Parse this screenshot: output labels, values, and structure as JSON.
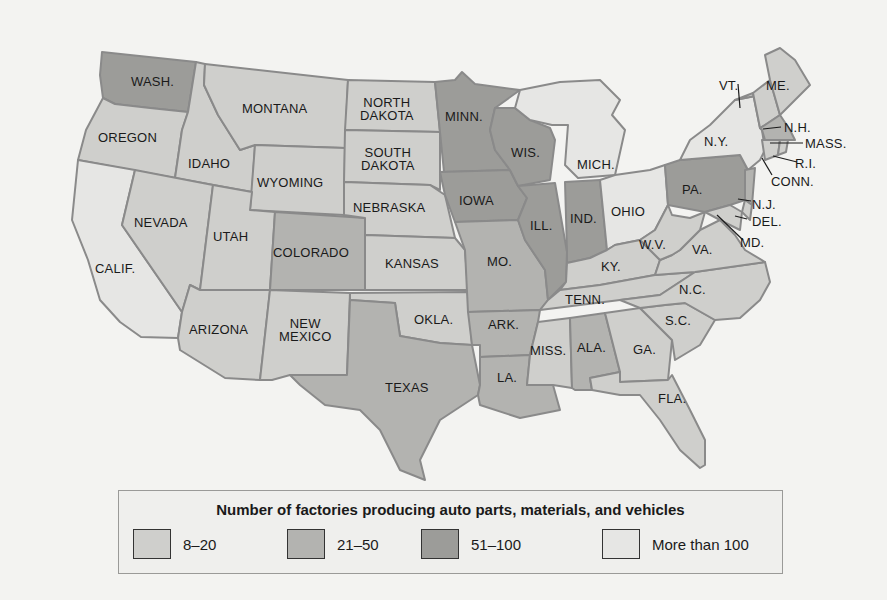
{
  "legend": {
    "title": "Number of factories producing auto parts, materials, and vehicles",
    "items": [
      {
        "label": "8–20",
        "color": "#cfcfcc"
      },
      {
        "label": "21–50",
        "color": "#b3b3b0"
      },
      {
        "label": "51–100",
        "color": "#9c9c99"
      },
      {
        "label": "More than 100",
        "color": "#e6e6e4"
      }
    ]
  },
  "states": {
    "wash": "WASH.",
    "oregon": "OREGON",
    "calif": "CALIF.",
    "idaho": "IDAHO",
    "nevada": "NEVADA",
    "montana": "MONTANA",
    "wyoming": "WYOMING",
    "utah": "UTAH",
    "arizona": "ARIZONA",
    "colorado": "COLORADO",
    "new_mexico": "NEW\nMEXICO",
    "north_dakota": "NORTH\nDAKOTA",
    "south_dakota": "SOUTH\nDAKOTA",
    "nebraska": "NEBRASKA",
    "kansas": "KANSAS",
    "okla": "OKLA.",
    "texas": "TEXAS",
    "minn": "MINN.",
    "iowa": "IOWA",
    "mo": "MO.",
    "ark": "ARK.",
    "la": "LA.",
    "wis": "WIS.",
    "ill": "ILL.",
    "mich": "MICH.",
    "ind": "IND.",
    "ohio": "OHIO",
    "ky": "KY.",
    "tenn": "TENN.",
    "miss": "MISS.",
    "ala": "ALA.",
    "ga": "GA.",
    "fla": "FLA.",
    "sc": "S.C.",
    "nc": "N.C.",
    "va": "VA.",
    "wv": "W.V.",
    "pa": "PA.",
    "ny": "N.Y.",
    "vt": "VT.",
    "me": "ME.",
    "nh": "N.H.",
    "mass": "MASS.",
    "ri": "R.I.",
    "conn": "CONN.",
    "nj": "N.J.",
    "del": "DEL.",
    "md": "MD."
  },
  "categories": {
    "8-20": [
      "Oregon",
      "Idaho",
      "Montana",
      "Wyoming",
      "Nevada",
      "Utah",
      "Arizona",
      "New Mexico",
      "North Dakota",
      "South Dakota",
      "Nebraska",
      "Kansas",
      "Oklahoma",
      "Kentucky",
      "West Virginia",
      "Virginia",
      "Mississippi",
      "Georgia",
      "South Carolina",
      "Florida",
      "Tennessee",
      "North Carolina",
      "Vermont",
      "New Hampshire",
      "Maine",
      "Connecticut",
      "Rhode Island",
      "Delaware",
      "Maryland"
    ],
    "21-50": [
      "Colorado",
      "Texas",
      "Missouri",
      "Arkansas",
      "Louisiana",
      "Alabama",
      "New Jersey",
      "Massachusetts"
    ],
    "51-100": [
      "Washington",
      "Minnesota",
      "Wisconsin",
      "Iowa",
      "Illinois",
      "Indiana",
      "Pennsylvania"
    ],
    "More than 100": [
      "California",
      "Michigan",
      "Ohio",
      "New York"
    ]
  }
}
